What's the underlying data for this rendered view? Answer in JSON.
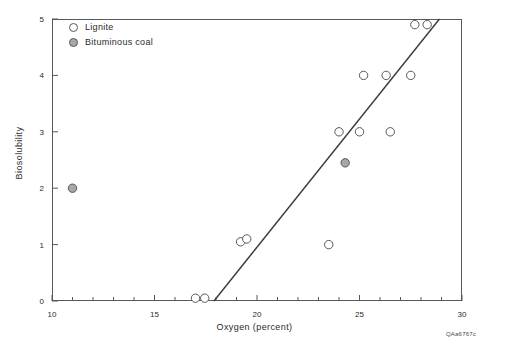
{
  "chart_data": {
    "type": "scatter",
    "title": "",
    "xlabel": "Oxygen (percent)",
    "ylabel": "Biosolubility",
    "xlim": [
      10,
      30
    ],
    "ylim": [
      0,
      5
    ],
    "xticks": [
      10,
      15,
      20,
      25,
      30
    ],
    "xtick_labels": [
      "10",
      "15",
      "20",
      "25",
      "30"
    ],
    "xminor_step": 1,
    "yticks": [
      0,
      1,
      2,
      3,
      4,
      5
    ],
    "ytick_labels": [
      "0",
      "1",
      "2",
      "3",
      "4",
      "5"
    ],
    "grid": false,
    "legend_position": "top-left",
    "series": [
      {
        "name": "Lignite",
        "marker": "open-circle",
        "marker_fill": "#ffffff",
        "marker_edge": "#55585c",
        "points": [
          {
            "x": 17.0,
            "y": 0.05
          },
          {
            "x": 17.45,
            "y": 0.05
          },
          {
            "x": 19.2,
            "y": 1.05
          },
          {
            "x": 19.5,
            "y": 1.1
          },
          {
            "x": 23.5,
            "y": 1.0
          },
          {
            "x": 24.0,
            "y": 3.0
          },
          {
            "x": 25.0,
            "y": 3.0
          },
          {
            "x": 26.5,
            "y": 3.0
          },
          {
            "x": 25.2,
            "y": 4.0
          },
          {
            "x": 26.3,
            "y": 4.0
          },
          {
            "x": 27.5,
            "y": 4.0
          },
          {
            "x": 27.7,
            "y": 4.9
          },
          {
            "x": 28.3,
            "y": 4.9
          }
        ]
      },
      {
        "name": "Bituminous coal",
        "marker": "shaded-circle",
        "marker_fill": "#a8a8a8",
        "marker_edge": "#55585c",
        "points": [
          {
            "x": 11.0,
            "y": 2.0
          },
          {
            "x": 24.3,
            "y": 2.45
          }
        ]
      }
    ],
    "regression_line": {
      "x_start": 17.9,
      "y_start": 0.0,
      "x_end": 28.9,
      "y_end": 5.0,
      "color": "#3a3a3a"
    }
  },
  "legend": {
    "items": [
      {
        "label": "Lignite",
        "marker": "open-circle"
      },
      {
        "label": "Bituminous coal",
        "marker": "shaded-circle"
      }
    ]
  },
  "footer": {
    "figure_code": "QAa6767c"
  },
  "colors": {
    "axis": "#55585c",
    "line": "#3a3a3a",
    "bituminous_fill": "#a8a8a8",
    "background": "#ffffff"
  }
}
